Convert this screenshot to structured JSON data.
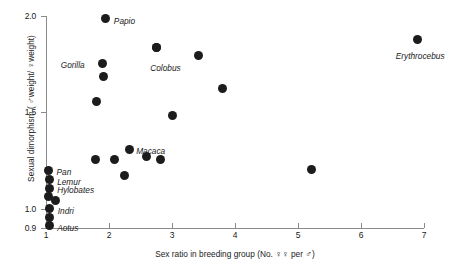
{
  "chart_data": {
    "type": "scatter",
    "title": "",
    "xlabel": "Sex ratio in breeding group (No. ♀♀ per ♂)",
    "ylabel": "Sexual dimorphism ( ♂weight/ ♀weight)",
    "xlim": [
      1,
      7
    ],
    "ylim": [
      0.9,
      2.0
    ],
    "grid": false,
    "legend": null,
    "xticks": [
      1,
      2,
      3,
      4,
      5,
      6,
      7
    ],
    "xtick_labels": [
      "1",
      "2",
      "3",
      "4",
      "5",
      "6",
      "7"
    ],
    "yticks": [
      0.9,
      1.0,
      1.5,
      2.0
    ],
    "ytick_labels": [
      "0.9",
      "1.0",
      "1.5",
      "2.0"
    ],
    "marker": "filled-circle",
    "marker_color": "#1c1c1c",
    "points": [
      {
        "label": "Papio",
        "x": 1.95,
        "y": 1.985,
        "label_dx": 8,
        "label_dy": -2
      },
      {
        "label": "",
        "x": 2.75,
        "y": 1.835,
        "label_dx": 0,
        "label_dy": 0
      },
      {
        "label": "Gorilla",
        "x": 1.9,
        "y": 1.755,
        "label_dx": -42,
        "label_dy": -2
      },
      {
        "label": "Colobus",
        "x": 2.75,
        "y": 1.835,
        "label_dx": -6,
        "label_dy": 16
      },
      {
        "label": "",
        "x": 1.92,
        "y": 1.685,
        "label_dx": 0,
        "label_dy": 0
      },
      {
        "label": "",
        "x": 1.8,
        "y": 1.555,
        "label_dx": 0,
        "label_dy": 0
      },
      {
        "label": "",
        "x": 3.42,
        "y": 1.795,
        "label_dx": 0,
        "label_dy": 0
      },
      {
        "label": "",
        "x": 3.8,
        "y": 1.625,
        "label_dx": 0,
        "label_dy": 0
      },
      {
        "label": "",
        "x": 3.0,
        "y": 1.485,
        "label_dx": 0,
        "label_dy": 0
      },
      {
        "label": "Erythrocebus",
        "x": 6.9,
        "y": 1.88,
        "label_dx": -22,
        "label_dy": 13
      },
      {
        "label": "Macaca",
        "x": 2.32,
        "y": 1.305,
        "label_dx": 7,
        "label_dy": -3
      },
      {
        "label": "",
        "x": 1.78,
        "y": 1.255,
        "label_dx": 0,
        "label_dy": 0
      },
      {
        "label": "",
        "x": 2.08,
        "y": 1.255,
        "label_dx": 0,
        "label_dy": 0
      },
      {
        "label": "",
        "x": 2.6,
        "y": 1.27,
        "label_dx": 0,
        "label_dy": 0
      },
      {
        "label": "",
        "x": 2.82,
        "y": 1.255,
        "label_dx": 0,
        "label_dy": 0
      },
      {
        "label": "",
        "x": 2.25,
        "y": 1.17,
        "label_dx": 0,
        "label_dy": 0
      },
      {
        "label": "",
        "x": 5.22,
        "y": 1.205,
        "label_dx": 0,
        "label_dy": 0
      },
      {
        "label": "Pan",
        "x": 1.04,
        "y": 1.2,
        "label_dx": 8,
        "label_dy": -2
      },
      {
        "label": "Lemur",
        "x": 1.05,
        "y": 1.15,
        "label_dx": 8,
        "label_dy": -2
      },
      {
        "label": "Hylobates",
        "x": 1.05,
        "y": 1.105,
        "label_dx": 8,
        "label_dy": -2
      },
      {
        "label": "",
        "x": 1.04,
        "y": 1.065,
        "label_dx": 0,
        "label_dy": 0
      },
      {
        "label": "",
        "x": 1.15,
        "y": 1.045,
        "label_dx": 0,
        "label_dy": 0
      },
      {
        "label": "Indri",
        "x": 1.06,
        "y": 1.0,
        "label_dx": 8,
        "label_dy": -2
      },
      {
        "label": "",
        "x": 1.05,
        "y": 0.955,
        "label_dx": 0,
        "label_dy": 0
      },
      {
        "label": "Aotus",
        "x": 1.05,
        "y": 0.912,
        "label_dx": 8,
        "label_dy": -2
      }
    ]
  }
}
